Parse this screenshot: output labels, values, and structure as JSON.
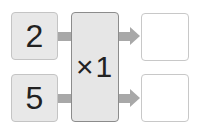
{
  "diagram": {
    "inputs": [
      {
        "value": "2"
      },
      {
        "value": "5"
      }
    ],
    "machine": {
      "operation": "×1"
    },
    "outputs": [
      {
        "value": ""
      },
      {
        "value": ""
      }
    ]
  }
}
